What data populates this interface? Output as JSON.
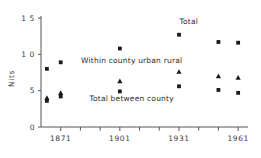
{
  "chart_data": {
    "type": "scatter",
    "title": "",
    "xlabel": "",
    "ylabel": "Nits",
    "xlim": [
      1861,
      1966
    ],
    "ylim": [
      0,
      1.5
    ],
    "grid": false,
    "legend_position": "inline-annotations",
    "x_ticks": [
      1871,
      1901,
      1931,
      1961
    ],
    "x_tick_labels": [
      "1871",
      "1901",
      "1931",
      "1961"
    ],
    "x_minor_ticks": [
      1881,
      1891,
      1911,
      1921,
      1941,
      1951
    ],
    "y_ticks": [
      0,
      0.5,
      1.0,
      1.5
    ],
    "y_tick_labels": [
      "0",
      "5",
      "1 0",
      "1 5"
    ],
    "annotations": [
      {
        "text": "Total",
        "x": 1936,
        "y": 1.42
      },
      {
        "text": "Within county urban rural",
        "x": 1907,
        "y": 0.88
      },
      {
        "text": "Total between county",
        "x": 1907,
        "y": 0.36
      }
    ],
    "series": [
      {
        "name": "Total",
        "marker": "square",
        "points": [
          {
            "x": 1864,
            "y": 0.8
          },
          {
            "x": 1871,
            "y": 0.89
          },
          {
            "x": 1901,
            "y": 1.08
          },
          {
            "x": 1931,
            "y": 1.27
          },
          {
            "x": 1951,
            "y": 1.17
          },
          {
            "x": 1961,
            "y": 1.16
          }
        ]
      },
      {
        "name": "Within county urban rural",
        "marker": "triangle",
        "points": [
          {
            "x": 1864,
            "y": 0.4
          },
          {
            "x": 1871,
            "y": 0.47
          },
          {
            "x": 1901,
            "y": 0.63
          },
          {
            "x": 1931,
            "y": 0.76
          },
          {
            "x": 1951,
            "y": 0.7
          },
          {
            "x": 1961,
            "y": 0.68
          }
        ]
      },
      {
        "name": "Total between county",
        "marker": "square",
        "points": [
          {
            "x": 1864,
            "y": 0.36
          },
          {
            "x": 1871,
            "y": 0.42
          },
          {
            "x": 1901,
            "y": 0.49
          },
          {
            "x": 1931,
            "y": 0.56
          },
          {
            "x": 1951,
            "y": 0.51
          },
          {
            "x": 1961,
            "y": 0.47
          }
        ]
      }
    ]
  }
}
